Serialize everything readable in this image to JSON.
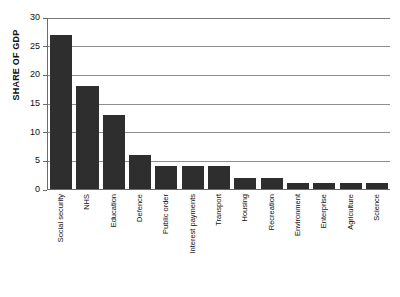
{
  "chart_data": {
    "type": "bar",
    "title": "",
    "xlabel": "",
    "ylabel": "SHARE OF GDP",
    "ylim": [
      0,
      30
    ],
    "yticks": [
      0,
      5,
      10,
      15,
      20,
      25,
      30
    ],
    "grid": true,
    "legend": null,
    "orientation": "vertical",
    "bar_color": "#2e2e2e",
    "categories": [
      "Social security",
      "NHS",
      "Education",
      "Defence",
      "Public order",
      "Interest payments",
      "Transport",
      "Housing",
      "Recreation",
      "Environment",
      "Enterprise",
      "Agriculture",
      "Science"
    ],
    "values": [
      27,
      18,
      13,
      6,
      4,
      4,
      4,
      2,
      2,
      1,
      1,
      1,
      1
    ]
  }
}
